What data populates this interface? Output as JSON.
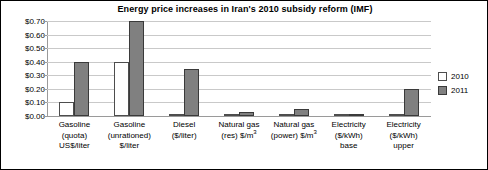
{
  "chart_data": {
    "type": "bar",
    "title": "Energy price increases in Iran's 2010 subsidy reform (IMF)",
    "xlabel": "",
    "ylabel": "",
    "ylim": [
      0,
      0.7
    ],
    "ytick_values": [
      0.7,
      0.6,
      0.5,
      0.4,
      0.3,
      0.2,
      0.1,
      0.0
    ],
    "ytick_labels": [
      "$0.70",
      "$0.60",
      "$0.50",
      "$0.40",
      "$0.30",
      "$0.20",
      "$0.10",
      "$0.00"
    ],
    "grid": true,
    "legend_position": "right",
    "categories": [
      {
        "lines": [
          "Gasoline",
          "(quota)",
          "US$/liter"
        ]
      },
      {
        "lines": [
          "Gasoline",
          "(unrationed)",
          "$/liter"
        ]
      },
      {
        "lines": [
          "Diesel",
          "($/liter)"
        ]
      },
      {
        "lines": [
          "Natural gas",
          "(res) $/m<sup>3</sup>"
        ]
      },
      {
        "lines": [
          "Natural gas",
          "(power) $/m<sup>3</sup>"
        ]
      },
      {
        "lines": [
          "Electricity",
          "($/kWh)",
          "base"
        ]
      },
      {
        "lines": [
          "Electricity",
          "($/kWh)",
          "upper"
        ]
      }
    ],
    "series": [
      {
        "name": "2010",
        "color": "#ffffff",
        "values": [
          0.1,
          0.4,
          0.015,
          0.005,
          0.005,
          0.008,
          0.015
        ]
      },
      {
        "name": "2011",
        "color": "#808080",
        "values": [
          0.4,
          0.7,
          0.35,
          0.03,
          0.05,
          0.015,
          0.2
        ]
      }
    ]
  },
  "legend": {
    "items": [
      {
        "label": "2010"
      },
      {
        "label": "2011"
      }
    ]
  }
}
